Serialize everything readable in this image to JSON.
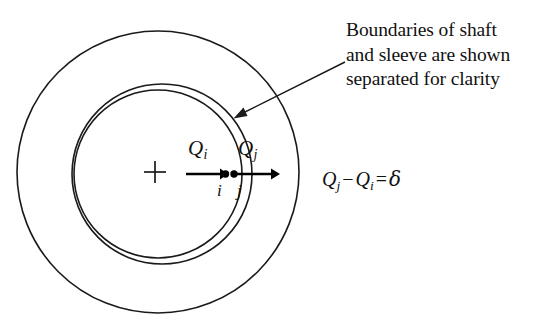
{
  "figure": {
    "kind": "engineering-cross-section-diagram",
    "background_color": "#ffffff",
    "stroke_color": "#1a1a1a",
    "callout": {
      "lines": [
        "Boundaries of shaft",
        "and sleeve are shown",
        "separated for clarity"
      ],
      "leader_line": {
        "from_x": 345,
        "from_y": 63,
        "to_x": 234,
        "to_y": 119,
        "arrowhead": "at-to-end"
      }
    },
    "center_marker": {
      "name": "plus",
      "x": 155,
      "y": 172,
      "arm_length": 11
    },
    "circles": [
      {
        "name": "sleeve-outer-boundary",
        "cx": 158,
        "cy": 172,
        "r": 141
      },
      {
        "name": "sleeve-inner-boundary",
        "cx": 162,
        "cy": 174,
        "r": 90
      },
      {
        "name": "shaft-outer-boundary",
        "cx": 158,
        "cy": 174,
        "r": 84
      }
    ],
    "radius_arrows": [
      {
        "name": "Qi-arrow",
        "x1": 186,
        "y1": 174,
        "x2": 226,
        "y2": 174
      },
      {
        "name": "Qj-arrow",
        "x1": 232,
        "y1": 174,
        "x2": 279,
        "y2": 174
      }
    ],
    "points": [
      {
        "name": "point-i",
        "x": 226,
        "y": 174,
        "label": "i"
      },
      {
        "name": "point-j",
        "x": 234,
        "y": 174,
        "label": "j"
      }
    ],
    "labels": {
      "qi": {
        "symbol": "Q",
        "subscript": "i"
      },
      "qj": {
        "symbol": "Q",
        "subscript": "j"
      },
      "point_i": "i",
      "point_j": "j"
    },
    "equation": {
      "lhs_first": {
        "symbol": "Q",
        "subscript": "j"
      },
      "operator": "−",
      "lhs_second": {
        "symbol": "Q",
        "subscript": "i"
      },
      "equals": "=",
      "rhs": "δ",
      "full_text": "Qj − Qi = δ"
    },
    "top_edge_artifact": " "
  }
}
